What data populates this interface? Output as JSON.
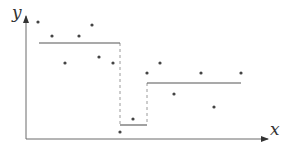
{
  "diagram": {
    "type": "piecewise-constant-fit",
    "axes": {
      "x_label": "x",
      "y_label": "y",
      "origin": [
        26,
        139
      ],
      "x_end": [
        268,
        139
      ],
      "y_end": [
        26,
        16
      ]
    },
    "points": [
      [
        38,
        22
      ],
      [
        52,
        36
      ],
      [
        65,
        63
      ],
      [
        79,
        36
      ],
      [
        92,
        25
      ],
      [
        99,
        57
      ],
      [
        113,
        63
      ],
      [
        120,
        132
      ],
      [
        133,
        119
      ],
      [
        147,
        73
      ],
      [
        160,
        63
      ],
      [
        174,
        94
      ],
      [
        201,
        73
      ],
      [
        214,
        107
      ],
      [
        241,
        73
      ]
    ],
    "steps": [
      {
        "x1": 39,
        "x2": 120,
        "y": 43
      },
      {
        "x1": 120,
        "x2": 147,
        "y": 125
      },
      {
        "x1": 147,
        "x2": 241,
        "y": 83
      }
    ],
    "splits": [
      {
        "x": 120,
        "y1": 43,
        "y2": 125
      },
      {
        "x": 147,
        "y1": 83,
        "y2": 125
      }
    ],
    "colors": {
      "axis": "#6b6b6b",
      "step": "#555555",
      "split": "#9a9a9a",
      "point": "#444444"
    }
  }
}
